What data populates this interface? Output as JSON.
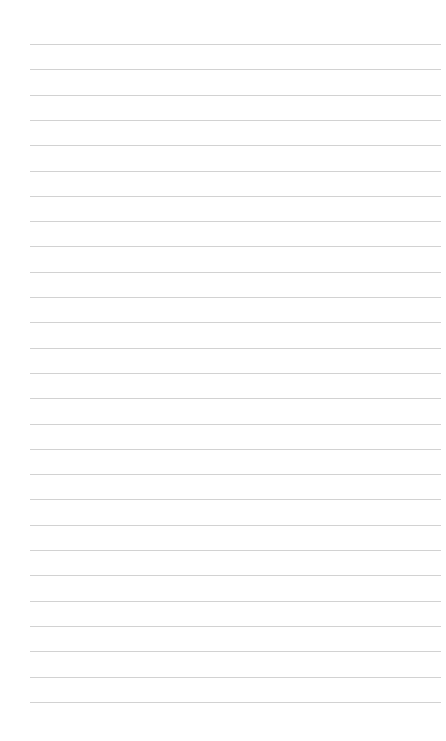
{
  "page": {
    "type": "lined-paper",
    "line_color": "#d2d2d2",
    "background": "#ffffff",
    "line_count": 27,
    "first_line_y": 44,
    "line_spacing": 25.3,
    "line_left": 30,
    "line_right": 441,
    "lines": [
      "",
      "",
      "",
      "",
      "",
      "",
      "",
      "",
      "",
      "",
      "",
      "",
      "",
      "",
      "",
      "",
      "",
      "",
      "",
      "",
      "",
      "",
      "",
      "",
      "",
      "",
      ""
    ]
  }
}
